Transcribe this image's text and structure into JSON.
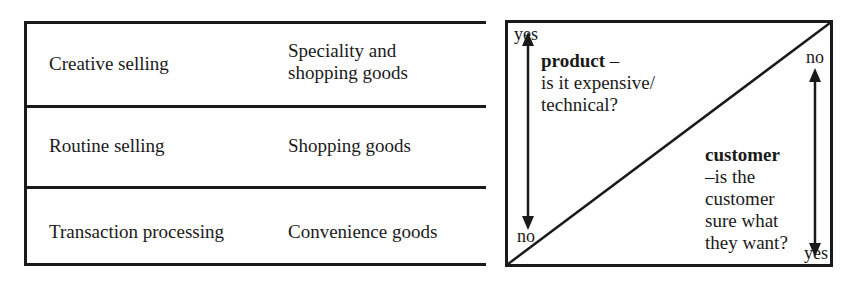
{
  "table": {
    "rows": [
      {
        "selling_type": "Creative selling",
        "goods_line1": "Speciality and",
        "goods_line2": "shopping goods"
      },
      {
        "selling_type": "Routine selling",
        "goods": "Shopping goods"
      },
      {
        "selling_type": "Transaction processing",
        "goods": "Convenience goods"
      }
    ]
  },
  "diagram": {
    "left_axis": {
      "top_label": "yes",
      "bottom_label": "no"
    },
    "right_axis": {
      "top_label": "no",
      "bottom_label": "yes"
    },
    "product": {
      "title": "product",
      "dash": " –",
      "line1": "is it expensive/",
      "line2": "technical?"
    },
    "customer": {
      "title": "customer",
      "line1": "–is the",
      "line2": "customer",
      "line3": "sure what",
      "line4": "they want?"
    }
  }
}
